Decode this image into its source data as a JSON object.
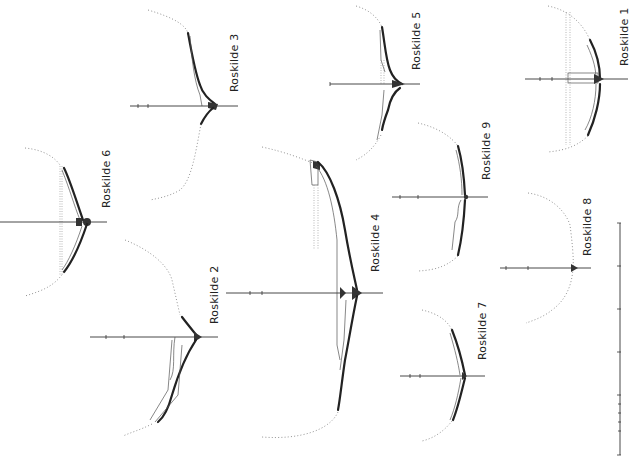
{
  "figure": {
    "orientation": "rotated 90 degrees counter-clockwise",
    "sections": [
      {
        "id": "r1",
        "label": "Roskilde 1"
      },
      {
        "id": "r2",
        "label": "Roskilde 2"
      },
      {
        "id": "r3",
        "label": "Roskilde 3"
      },
      {
        "id": "r4",
        "label": "Roskilde 4"
      },
      {
        "id": "r5",
        "label": "Roskilde 5"
      },
      {
        "id": "r6",
        "label": "Roskilde 6"
      },
      {
        "id": "r7",
        "label": "Roskilde 7"
      },
      {
        "id": "r8",
        "label": "Roskilde 8"
      },
      {
        "id": "r9",
        "label": "Roskilde 9"
      }
    ],
    "scale_bar": {
      "ticks": 6,
      "subdivided_last_segment": true
    },
    "colors": {
      "line": "#222222",
      "dotted": "#777777",
      "background": "#ffffff"
    }
  }
}
